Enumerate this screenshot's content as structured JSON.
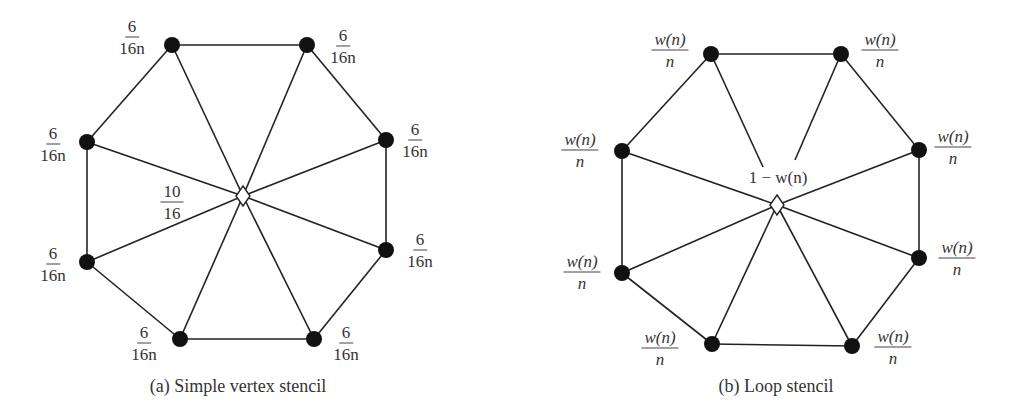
{
  "figures": [
    {
      "id": "a",
      "caption": "(a) Simple vertex stencil",
      "center_weight": {
        "num": "10",
        "den": "16"
      },
      "neighbor_weight": {
        "num": "6",
        "den": "16n"
      },
      "vertex_count": 8,
      "labels": [
        {
          "num": "6",
          "den": "16n"
        },
        {
          "num": "6",
          "den": "16n"
        },
        {
          "num": "6",
          "den": "16n"
        },
        {
          "num": "6",
          "den": "16n"
        },
        {
          "num": "6",
          "den": "16n"
        },
        {
          "num": "6",
          "den": "16n"
        },
        {
          "num": "6",
          "den": "16n"
        },
        {
          "num": "6",
          "den": "16n"
        }
      ]
    },
    {
      "id": "b",
      "caption": "(b) Loop stencil",
      "center_weight": "1 − w(n)",
      "neighbor_weight": {
        "num": "w(n)",
        "den": "n"
      },
      "vertex_count": 8,
      "labels": [
        {
          "num": "w(n)",
          "den": "n"
        },
        {
          "num": "w(n)",
          "den": "n"
        },
        {
          "num": "w(n)",
          "den": "n"
        },
        {
          "num": "w(n)",
          "den": "n"
        },
        {
          "num": "w(n)",
          "den": "n"
        },
        {
          "num": "w(n)",
          "den": "n"
        },
        {
          "num": "w(n)",
          "den": "n"
        },
        {
          "num": "w(n)",
          "den": "n"
        }
      ]
    }
  ]
}
